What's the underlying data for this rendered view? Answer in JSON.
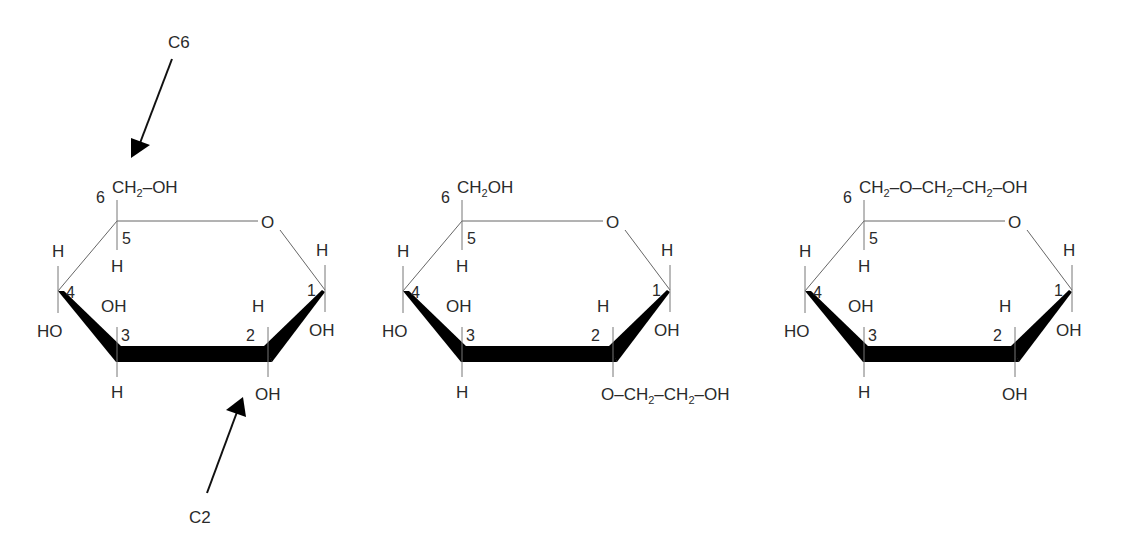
{
  "diagram": {
    "type": "haworth-projections",
    "colors": {
      "background": "#ffffff",
      "bond": "#000000",
      "text": "#2a2a2a"
    },
    "annotations": {
      "c6_arrow_label": "C6",
      "c2_arrow_label": "C2"
    },
    "rings": [
      {
        "id": "unsubstituted",
        "c6_substituent": "CH₂–OH",
        "c6_sub_parts": [
          "CH",
          "2",
          "–OH"
        ],
        "ring_oxygen": "O",
        "c1_top": "H",
        "c1_bottom": "OH",
        "c2_top": "H",
        "c2_bottom": "OH",
        "c3_top": "OH",
        "c3_bottom": "H",
        "c4_top": "H",
        "c4_bottom": "HO",
        "c5_bottom": "H",
        "numbers": [
          "1",
          "2",
          "3",
          "4",
          "5",
          "6"
        ]
      },
      {
        "id": "2-O-hydroxyethyl",
        "c6_substituent": "CH₂OH",
        "c6_sub_parts": [
          "CH",
          "2",
          "OH"
        ],
        "ring_oxygen": "O",
        "c1_top": "H",
        "c1_bottom": "OH",
        "c2_top": "H",
        "c2_bottom": "O–CH₂–CH₂–OH",
        "c2_bottom_parts": [
          "O–CH",
          "2",
          "–CH",
          "2",
          "–OH"
        ],
        "c3_top": "OH",
        "c3_bottom": "H",
        "c4_top": "H",
        "c4_bottom": "HO",
        "c5_bottom": "H",
        "numbers": [
          "1",
          "2",
          "3",
          "4",
          "5",
          "6"
        ]
      },
      {
        "id": "6-O-hydroxyethyl",
        "c6_substituent": "CH₂–O–CH₂–CH₂–OH",
        "c6_sub_parts": [
          "CH",
          "2",
          "–O–CH",
          "2",
          "–CH",
          "2",
          "–OH"
        ],
        "ring_oxygen": "O",
        "c1_top": "H",
        "c1_bottom": "OH",
        "c2_top": "H",
        "c2_bottom": "OH",
        "c3_top": "OH",
        "c3_bottom": "H",
        "c4_top": "H",
        "c4_bottom": "HO",
        "c5_bottom": "H",
        "numbers": [
          "1",
          "2",
          "3",
          "4",
          "5",
          "6"
        ]
      }
    ]
  }
}
